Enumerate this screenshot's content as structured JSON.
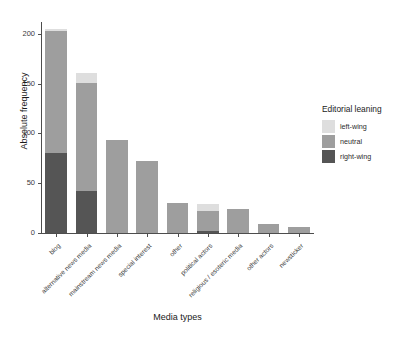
{
  "chart_data": {
    "type": "bar",
    "stacked": true,
    "title": "",
    "xlabel": "Media types",
    "ylabel": "Absolute frequency",
    "categories": [
      "blog",
      "alternative news media",
      "mainstream news media",
      "special interest",
      "other",
      "political actors",
      "religious / esoteric media",
      "other actors",
      "newsticker"
    ],
    "series": [
      {
        "name": "right-wing",
        "color": "#555555",
        "values": [
          80,
          42,
          0,
          0,
          0,
          2,
          0,
          0,
          0
        ]
      },
      {
        "name": "neutral",
        "color": "#9e9e9e",
        "values": [
          123,
          109,
          93,
          72,
          30,
          20,
          24,
          9,
          6
        ]
      },
      {
        "name": "left-wing",
        "color": "#dedede",
        "values": [
          2,
          10,
          0,
          0,
          0,
          7,
          0,
          0,
          0
        ]
      }
    ],
    "totals": [
      205,
      161,
      93,
      72,
      30,
      29,
      24,
      9,
      6
    ],
    "ylim": [
      0,
      212
    ],
    "yticks": [
      0,
      50,
      100,
      150,
      200
    ],
    "ytick_labels": [
      "0",
      "50",
      "100",
      "150",
      "200"
    ],
    "grid": false,
    "legend_position": "right"
  },
  "legend": {
    "title": "Editorial leaning",
    "entries": [
      {
        "label": "left-wing",
        "color": "#dedede"
      },
      {
        "label": "neutral",
        "color": "#9e9e9e"
      },
      {
        "label": "right-wing",
        "color": "#555555"
      }
    ]
  },
  "caption": {
    "text": ""
  }
}
